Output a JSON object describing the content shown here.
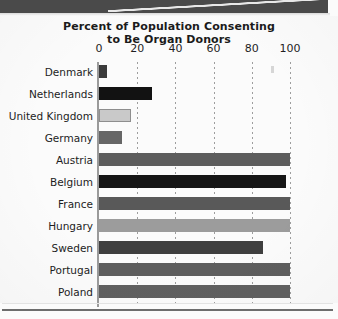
{
  "chart_data": {
    "type": "bar",
    "orientation": "horizontal",
    "title": "Percent of Population Consenting to Be Organ Donors",
    "title_lines": [
      "Percent of Population Consenting",
      "to Be Organ Donors"
    ],
    "xlabel": "",
    "ylabel": "",
    "xlim": [
      0,
      100
    ],
    "ticks": [
      0,
      20,
      40,
      60,
      80,
      100
    ],
    "tick_labels": [
      "0",
      "20",
      "40",
      "60",
      "80",
      "100"
    ],
    "grid": true,
    "grid_style": "dotted-vertical",
    "legend": "none",
    "categories": [
      "Denmark",
      "Netherlands",
      "United Kingdom",
      "Germany",
      "Austria",
      "Belgium",
      "France",
      "Hungary",
      "Sweden",
      "Portugal",
      "Poland"
    ],
    "values": [
      4,
      28,
      17,
      12,
      100,
      98,
      100,
      100,
      86,
      100,
      100
    ],
    "bar_colors": [
      "#3b3b3b",
      "#121212",
      "#c9c9c9",
      "#666666",
      "#5d5d5d",
      "#161616",
      "#595959",
      "#9c9c9c",
      "#3f3f3f",
      "#5e5e5e",
      "#606060"
    ]
  },
  "axis": {
    "tick_labels": [
      "0",
      "20",
      "40",
      "60",
      "80",
      "100"
    ]
  },
  "colors": {
    "banner": "#4a4a4a",
    "page": "#fbfbfb",
    "text": "#1b1b1b",
    "gridline": "#9d9d9d",
    "axis": "#9a9a9a"
  }
}
